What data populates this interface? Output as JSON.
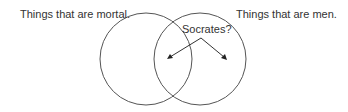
{
  "diagram": {
    "type": "venn",
    "sets": [
      {
        "id": "mortal",
        "label": "Things that are mortal."
      },
      {
        "id": "men",
        "label": "Things that are men."
      }
    ],
    "question": {
      "label": "Socrates?",
      "points_to": [
        "intersection",
        "men-only"
      ]
    },
    "colors": {
      "stroke": "#555555",
      "text": "#333333",
      "arrow": "#333333",
      "background": "#ffffff"
    }
  }
}
